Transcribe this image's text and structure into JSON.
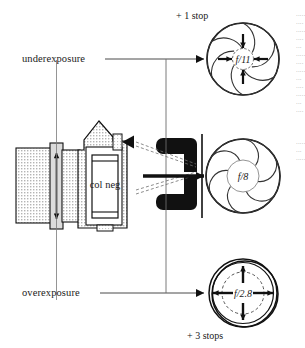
{
  "figure": {
    "background_color": "#ffffff",
    "ink_color": "#1a1a1a",
    "stipple_color": "#b9b9b9",
    "rule_color": "#6b6b6b"
  },
  "labels": {
    "underexposure": "underexposure",
    "overexposure": "overexposure",
    "plus_one_stop": "+ 1 stop",
    "plus_three_stops": "+ 3 stops",
    "col_neg": "col neg"
  },
  "apertures": [
    {
      "id": "aperture-f11",
      "fstop": "f/11",
      "position": "top",
      "state": "stopped-down",
      "arrow_direction": "inward",
      "arrow_count": 4,
      "stop_label": "+ 1 stop",
      "exposure_label": "underexposure",
      "blade_count": 7,
      "opening_ratio": 0.26
    },
    {
      "id": "aperture-f8",
      "fstop": "f/8",
      "position": "middle",
      "state": "normal",
      "arrow_direction": "none",
      "arrow_count": 0,
      "stop_label": "",
      "exposure_label": "",
      "blade_count": 7,
      "opening_ratio": 0.45
    },
    {
      "id": "aperture-f2-8",
      "fstop": "f/2.8",
      "position": "bottom",
      "state": "wide-open",
      "arrow_direction": "outward",
      "arrow_count": 4,
      "stop_label": "+ 3 stops",
      "exposure_label": "overexposure",
      "blade_count": 0,
      "opening_ratio": 0.62
    }
  ],
  "controls": {
    "minus_symbol": "−",
    "plus_symbol": "+",
    "minus_name": "decrease exposure",
    "plus_name": "increase exposure"
  },
  "edge_text_fragments": [
    "·····",
    "····",
    "······",
    "····",
    "···",
    "·····",
    "····",
    "·····",
    "···",
    "····",
    "·····",
    "···",
    "····"
  ]
}
